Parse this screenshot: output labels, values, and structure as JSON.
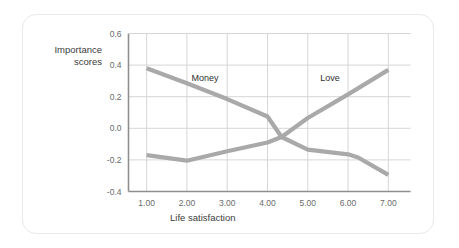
{
  "card": {
    "background": "#ffffff",
    "border_color": "#e9e9e9"
  },
  "chart_data": {
    "type": "line",
    "title": "",
    "xlabel": "Life satisfaction",
    "ylabel": "Importance\nscores",
    "x": [
      1.0,
      2.0,
      3.0,
      4.0,
      5.0,
      6.0,
      7.0
    ],
    "xticklabels": [
      "1.00",
      "2.00",
      "3.00",
      "4.00",
      "5.00",
      "6.00",
      "7.00"
    ],
    "yticklabels": [
      "0.6",
      "0.4",
      "0.2",
      "0.0",
      "-0.2",
      "-0.4"
    ],
    "yticks": [
      0.6,
      0.4,
      0.2,
      0.0,
      -0.2,
      -0.4
    ],
    "xlim": [
      0.55,
      7.55
    ],
    "ylim": [
      -0.4,
      0.6
    ],
    "grid": true,
    "legend": "inline-labels",
    "series": [
      {
        "name": "Money",
        "label": "Money",
        "color": "#a9a9a9",
        "label_x": 2.45,
        "label_y": 0.3,
        "values": [
          0.38,
          0.29,
          0.2,
          0.1,
          -0.01,
          -0.12,
          -0.23
        ]
      },
      {
        "name": "Love",
        "label": "Love",
        "color": "#a9a9a9",
        "label_x": 5.55,
        "label_y": 0.3,
        "values": [
          -0.17,
          -0.2,
          -0.15,
          -0.09,
          -0.13,
          -0.16,
          -0.3
        ]
      }
    ],
    "drawn_paths": {
      "descending": [
        {
          "x": 1.0,
          "y": 0.38
        },
        {
          "x": 2.0,
          "y": 0.285
        },
        {
          "x": 3.0,
          "y": 0.185
        },
        {
          "x": 4.0,
          "y": 0.075
        },
        {
          "x": 4.35,
          "y": -0.055
        },
        {
          "x": 5.0,
          "y": -0.135
        },
        {
          "x": 6.0,
          "y": -0.165
        },
        {
          "x": 6.25,
          "y": -0.185
        },
        {
          "x": 7.0,
          "y": -0.295
        }
      ],
      "ascending": [
        {
          "x": 1.0,
          "y": -0.17
        },
        {
          "x": 2.0,
          "y": -0.205
        },
        {
          "x": 3.0,
          "y": -0.145
        },
        {
          "x": 4.0,
          "y": -0.09
        },
        {
          "x": 4.35,
          "y": -0.055
        },
        {
          "x": 5.0,
          "y": 0.065
        },
        {
          "x": 6.0,
          "y": 0.215
        },
        {
          "x": 7.0,
          "y": 0.37
        }
      ]
    },
    "style": {
      "line_width": 4.2,
      "grid_color": "#d6d6d6",
      "axis_color": "#8f8f8f",
      "plot_bg": "#ffffff"
    }
  }
}
